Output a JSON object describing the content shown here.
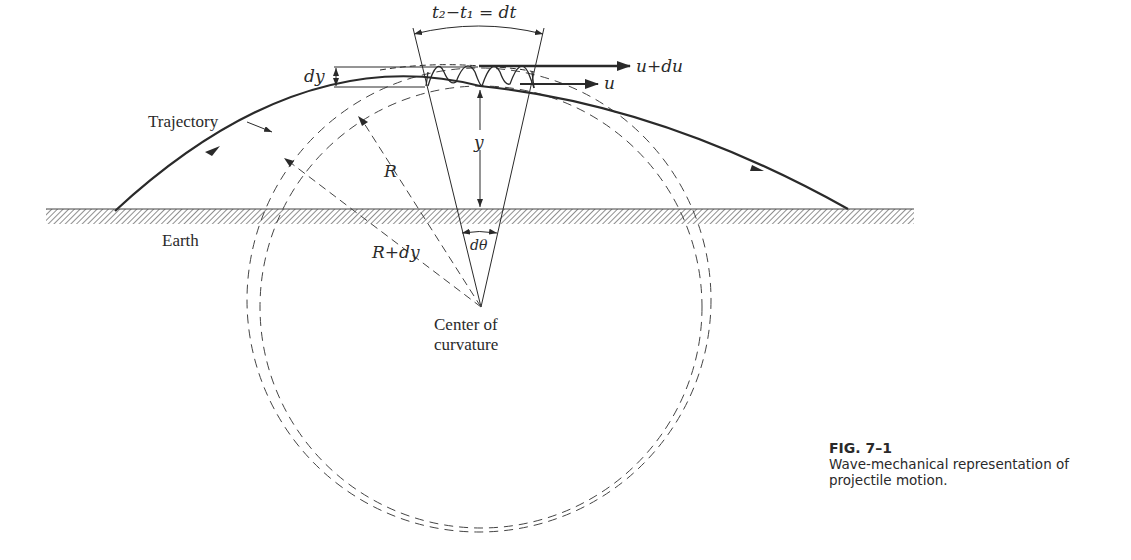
{
  "figure": {
    "number": "FIG. 7–1",
    "caption": "Wave-mechanical representation of projectile motion."
  },
  "labels": {
    "time_interval": "t₂−t₁ = dt",
    "velocity_top": "u+du",
    "velocity_bottom": "u",
    "dy": "dy",
    "trajectory": "Trajectory",
    "height": "y",
    "radius": "R",
    "radius_plus": "R+dy",
    "earth": "Earth",
    "dtheta": "dθ",
    "center_line1": "Center of",
    "center_line2": "curvature"
  },
  "colors": {
    "ink": "#2a2a2a",
    "background": "#ffffff"
  }
}
